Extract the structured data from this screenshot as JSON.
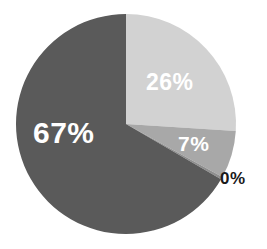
{
  "chart_data": {
    "type": "pie",
    "title": "",
    "subtitle": "",
    "xlabel": "",
    "ylabel": "",
    "grid": false,
    "legend_position": "none",
    "start_angle_deg": 0,
    "direction": "clockwise",
    "categories": [
      "Series 1",
      "Series 2",
      "Series 3",
      "Series 4"
    ],
    "values": [
      26,
      7,
      0,
      67
    ],
    "labels": [
      "26%",
      "7%",
      "0%",
      "67%"
    ],
    "colors": [
      "#d2d2d2",
      "#a8a8a8",
      "#8f8f8f",
      "#5a5a5a"
    ],
    "label_colors": [
      "#ffffff",
      "#ffffff",
      "#1a1a1a",
      "#ffffff"
    ],
    "slices": [
      {
        "name": "slice-26",
        "label": "26%",
        "value": 26,
        "color": "#d2d2d2",
        "label_color": "#ffffff",
        "label_placement": "inside",
        "start_deg": 0,
        "end_deg": 93.6
      },
      {
        "name": "slice-7",
        "label": "7%",
        "value": 7,
        "color": "#a8a8a8",
        "label_color": "#ffffff",
        "label_placement": "inside",
        "start_deg": 93.6,
        "end_deg": 118.8
      },
      {
        "name": "slice-0",
        "label": "0%",
        "value": 0,
        "color": "#8f8f8f",
        "label_color": "#1a1a1a",
        "label_placement": "outside",
        "start_deg": 118.8,
        "end_deg": 120.2
      },
      {
        "name": "slice-67",
        "label": "67%",
        "value": 67,
        "color": "#5a5a5a",
        "label_color": "#ffffff",
        "label_placement": "inside",
        "start_deg": 120.2,
        "end_deg": 360
      }
    ],
    "background_color": "#ffffff",
    "center_x": 126,
    "center_y": 124,
    "radius": 110
  },
  "labels": {
    "pct_67": "67%",
    "pct_26": "26%",
    "pct_7": "7%",
    "pct_0": "0%"
  }
}
